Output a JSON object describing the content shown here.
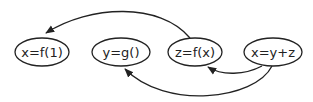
{
  "diagram": {
    "type": "dependency-graph",
    "colors": {
      "stroke": "#222222",
      "text": "#222222",
      "background": "#ffffff"
    },
    "nodes": [
      {
        "id": "n1",
        "label": "x=f(1)",
        "cx": 42,
        "cy": 52,
        "rx": 27,
        "ry": 14
      },
      {
        "id": "n2",
        "label": "y=g()",
        "cx": 121,
        "cy": 52,
        "rx": 29,
        "ry": 14
      },
      {
        "id": "n3",
        "label": "z=f(x)",
        "cx": 195,
        "cy": 52,
        "rx": 27,
        "ry": 14
      },
      {
        "id": "n4",
        "label": "x=y+z",
        "cx": 273,
        "cy": 52,
        "rx": 29,
        "ry": 14
      }
    ],
    "edges": [
      {
        "from": "z=f(x)",
        "to": "x=f(1)"
      },
      {
        "from": "x=y+z",
        "to": "z=f(x)"
      },
      {
        "from": "x=y+z",
        "to": "y=g()"
      }
    ]
  }
}
